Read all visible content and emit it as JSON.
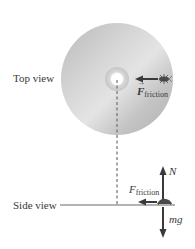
{
  "diagram": {
    "views": {
      "top": {
        "label": "Top view"
      },
      "side": {
        "label": "Side view"
      }
    },
    "forces": {
      "friction_top": {
        "symbol": "F",
        "subscript": "friction",
        "vector": true,
        "direction": "toward-center"
      },
      "friction_side": {
        "symbol": "F",
        "subscript": "friction",
        "vector": false,
        "direction": "left"
      },
      "normal": {
        "symbol": "N",
        "direction": "up"
      },
      "weight": {
        "symbol": "mg",
        "direction": "down"
      }
    },
    "objects": {
      "disk": {
        "type": "rotating-disk",
        "color": "#c8c8c8"
      },
      "bug": {
        "type": "insect-on-disk"
      }
    },
    "colors": {
      "arrow": "#3a3a3a",
      "disk": "#c8c8c8",
      "dashed_line": "#707070"
    }
  }
}
